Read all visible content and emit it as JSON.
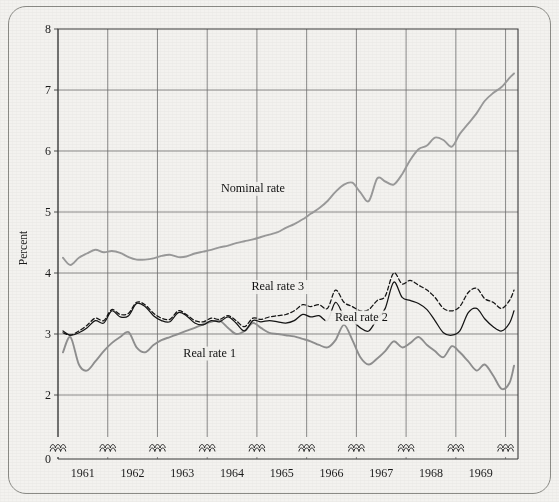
{
  "chart_data": {
    "type": "line",
    "title": "",
    "xlabel": "",
    "ylabel": "Percent",
    "ylim": [
      0,
      8
    ],
    "yticks": [
      0,
      2,
      3,
      4,
      5,
      6,
      7,
      8
    ],
    "ytick_labels": [
      "0",
      "2",
      "3",
      "4",
      "5",
      "6",
      "7",
      "8"
    ],
    "axis_break": "y-axis broken between 0 and 2; x-axis has squiggle break marks above the baseline at each year gridline",
    "xlim": [
      1960.5,
      1969.75
    ],
    "xticks": [
      1961,
      1962,
      1963,
      1964,
      1965,
      1966,
      1967,
      1968,
      1969
    ],
    "xtick_labels": [
      "1961",
      "1962",
      "1963",
      "1964",
      "1965",
      "1966",
      "1967",
      "1968",
      "1969"
    ],
    "grid": true,
    "legend": "inline annotations",
    "series": [
      {
        "name": "Nominal rate",
        "style": "solid",
        "color": "#9a9a9a",
        "label_x": 1964.42,
        "label_y": 5.33,
        "x": [
          1960.6,
          1960.75,
          1960.92,
          1961.08,
          1961.25,
          1961.42,
          1961.58,
          1961.75,
          1961.92,
          1962.08,
          1962.25,
          1962.42,
          1962.58,
          1962.75,
          1962.92,
          1963.08,
          1963.25,
          1963.42,
          1963.58,
          1963.75,
          1963.92,
          1964.08,
          1964.25,
          1964.42,
          1964.58,
          1964.75,
          1964.92,
          1965.08,
          1965.25,
          1965.42,
          1965.58,
          1965.75,
          1965.92,
          1966.08,
          1966.25,
          1966.42,
          1966.58,
          1966.75,
          1966.92,
          1967.08,
          1967.25,
          1967.42,
          1967.58,
          1967.75,
          1967.92,
          1968.08,
          1968.25,
          1968.42,
          1968.58,
          1968.75,
          1968.92,
          1969.08,
          1969.25,
          1969.42,
          1969.58,
          1969.67
        ],
        "y": [
          4.25,
          4.13,
          4.25,
          4.32,
          4.38,
          4.34,
          4.36,
          4.33,
          4.26,
          4.22,
          4.22,
          4.24,
          4.28,
          4.3,
          4.26,
          4.27,
          4.32,
          4.35,
          4.38,
          4.42,
          4.45,
          4.49,
          4.52,
          4.55,
          4.59,
          4.63,
          4.67,
          4.74,
          4.8,
          4.88,
          4.97,
          5.06,
          5.18,
          5.33,
          5.45,
          5.48,
          5.32,
          5.18,
          5.55,
          5.5,
          5.45,
          5.62,
          5.85,
          6.03,
          6.09,
          6.22,
          6.18,
          6.07,
          6.28,
          6.45,
          6.62,
          6.82,
          6.95,
          7.05,
          7.2,
          7.27
        ]
      },
      {
        "name": "Real rate 1",
        "style": "solid",
        "color": "#8f8f8f",
        "label_x": 1963.55,
        "label_y": 2.63,
        "x": [
          1960.6,
          1960.75,
          1960.92,
          1961.08,
          1961.25,
          1961.42,
          1961.58,
          1961.75,
          1961.92,
          1962.08,
          1962.25,
          1962.42,
          1962.58,
          1962.75,
          1962.92,
          1963.08,
          1963.25,
          1963.42,
          1963.58,
          1963.75,
          1963.92,
          1964.08,
          1964.25,
          1964.42,
          1964.58,
          1964.75,
          1964.92,
          1965.08,
          1965.25,
          1965.42,
          1965.58,
          1965.75,
          1965.92,
          1966.08,
          1966.25,
          1966.42,
          1966.58,
          1966.75,
          1966.92,
          1967.08,
          1967.25,
          1967.42,
          1967.58,
          1967.75,
          1967.92,
          1968.08,
          1968.25,
          1968.42,
          1968.58,
          1968.75,
          1968.92,
          1969.08,
          1969.25,
          1969.42,
          1969.58,
          1969.67
        ],
        "y": [
          2.7,
          2.95,
          2.5,
          2.4,
          2.55,
          2.72,
          2.85,
          2.95,
          3.03,
          2.78,
          2.7,
          2.82,
          2.9,
          2.95,
          3.0,
          3.05,
          3.1,
          3.16,
          3.2,
          3.22,
          3.1,
          3.0,
          3.05,
          3.18,
          3.1,
          3.02,
          3.0,
          2.98,
          2.96,
          2.92,
          2.88,
          2.82,
          2.78,
          2.9,
          3.15,
          2.9,
          2.62,
          2.5,
          2.6,
          2.72,
          2.88,
          2.78,
          2.85,
          2.95,
          2.82,
          2.72,
          2.62,
          2.8,
          2.7,
          2.55,
          2.4,
          2.5,
          2.32,
          2.1,
          2.2,
          2.48
        ]
      },
      {
        "name": "Real rate 2",
        "style": "solid",
        "color": "#141414",
        "label_x": 1966.6,
        "label_y": 3.22,
        "x": [
          1960.6,
          1960.75,
          1960.92,
          1961.08,
          1961.25,
          1961.42,
          1961.58,
          1961.75,
          1961.92,
          1962.08,
          1962.25,
          1962.42,
          1962.58,
          1962.75,
          1962.92,
          1963.08,
          1963.25,
          1963.42,
          1963.58,
          1963.75,
          1963.92,
          1964.08,
          1964.25,
          1964.42,
          1964.58,
          1964.75,
          1964.92,
          1965.08,
          1965.25,
          1965.42,
          1965.58,
          1965.75,
          1965.92,
          1966.08,
          1966.25,
          1966.42,
          1966.58,
          1966.75,
          1966.92,
          1967.08,
          1967.25,
          1967.42,
          1967.58,
          1967.75,
          1967.92,
          1968.08,
          1968.25,
          1968.42,
          1968.58,
          1968.75,
          1968.92,
          1969.08,
          1969.25,
          1969.42,
          1969.58,
          1969.67
        ],
        "y": [
          3.05,
          2.98,
          3.02,
          3.1,
          3.22,
          3.18,
          3.38,
          3.28,
          3.3,
          3.5,
          3.45,
          3.3,
          3.22,
          3.2,
          3.35,
          3.3,
          3.18,
          3.15,
          3.22,
          3.2,
          3.28,
          3.18,
          3.05,
          3.22,
          3.2,
          3.22,
          3.2,
          3.18,
          3.22,
          3.32,
          3.28,
          3.3,
          3.22,
          3.52,
          3.3,
          3.22,
          3.1,
          3.05,
          3.25,
          3.42,
          3.85,
          3.6,
          3.55,
          3.5,
          3.4,
          3.22,
          3.02,
          2.98,
          3.05,
          3.35,
          3.42,
          3.25,
          3.12,
          3.05,
          3.18,
          3.38
        ]
      },
      {
        "name": "Real rate 3",
        "style": "dashed",
        "color": "#141414",
        "label_x": 1964.92,
        "label_y": 3.72,
        "x": [
          1960.6,
          1960.75,
          1960.92,
          1961.08,
          1961.25,
          1961.42,
          1961.58,
          1961.75,
          1961.92,
          1962.08,
          1962.25,
          1962.42,
          1962.58,
          1962.75,
          1962.92,
          1963.08,
          1963.25,
          1963.42,
          1963.58,
          1963.75,
          1963.92,
          1964.08,
          1964.25,
          1964.42,
          1964.58,
          1964.75,
          1964.92,
          1965.08,
          1965.25,
          1965.42,
          1965.58,
          1965.75,
          1965.92,
          1966.08,
          1966.25,
          1966.42,
          1966.58,
          1966.75,
          1966.92,
          1967.08,
          1967.25,
          1967.42,
          1967.58,
          1967.75,
          1967.92,
          1968.08,
          1968.25,
          1968.42,
          1968.58,
          1968.75,
          1968.92,
          1969.08,
          1969.25,
          1969.42,
          1969.58,
          1969.67
        ],
        "y": [
          3.02,
          2.98,
          3.05,
          3.14,
          3.26,
          3.22,
          3.4,
          3.32,
          3.34,
          3.52,
          3.48,
          3.34,
          3.26,
          3.24,
          3.38,
          3.32,
          3.22,
          3.2,
          3.26,
          3.24,
          3.3,
          3.22,
          3.12,
          3.26,
          3.24,
          3.28,
          3.3,
          3.32,
          3.38,
          3.48,
          3.45,
          3.48,
          3.42,
          3.72,
          3.52,
          3.45,
          3.38,
          3.4,
          3.55,
          3.62,
          4.0,
          3.82,
          3.88,
          3.8,
          3.72,
          3.6,
          3.42,
          3.38,
          3.45,
          3.68,
          3.75,
          3.58,
          3.52,
          3.42,
          3.55,
          3.72
        ]
      }
    ]
  },
  "axes": {
    "y_axis_title": "Percent",
    "y_ticks": [
      "8",
      "7",
      "6",
      "5",
      "4",
      "3",
      "2",
      "0"
    ],
    "x_ticks": [
      "1961",
      "1962",
      "1963",
      "1964",
      "1965",
      "1966",
      "1967",
      "1968",
      "1969"
    ]
  },
  "annotations": [
    {
      "name": "nominal-rate-label",
      "text": "Nominal rate"
    },
    {
      "name": "real-rate-3-label",
      "text": "Real rate 3"
    },
    {
      "name": "real-rate-2-label",
      "text": "Real rate 2"
    },
    {
      "name": "real-rate-1-label",
      "text": "Real rate 1"
    }
  ],
  "colors": {
    "background": "#f3f2ef",
    "frame": "#8b8b86",
    "grid": "#6e6e6e",
    "nominal": "#9a9a9a",
    "real1": "#8f8f8f",
    "real2": "#141414",
    "real3": "#141414"
  }
}
